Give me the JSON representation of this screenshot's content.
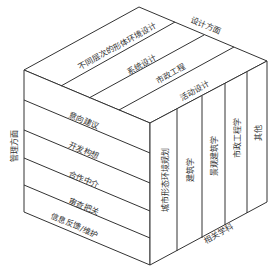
{
  "diagram": {
    "type": "3d-cube-matrix",
    "axes": {
      "design": "设计方面",
      "management": "管理方面",
      "disciplines": "相关学科"
    },
    "top_face": {
      "strips": [
        "不同层次的形体环境设计",
        "系统设计",
        "市政工程",
        "活动设计"
      ]
    },
    "left_face": {
      "rows": [
        "意向建议",
        "开发构想",
        "合作中介",
        "审查把关",
        "信息反馈/维护"
      ]
    },
    "right_face": {
      "columns": [
        "城市形态环境规划",
        "建筑学",
        "景观建筑学",
        "市政工程学",
        "其他"
      ]
    },
    "colors": {
      "line": "#333333",
      "background": "#ffffff"
    }
  }
}
